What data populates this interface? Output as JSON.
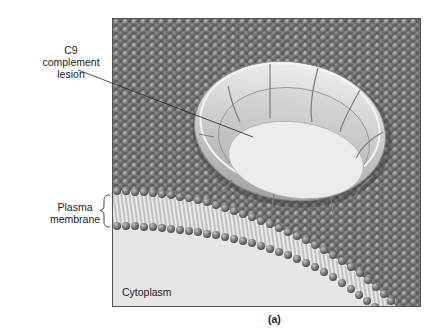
{
  "figure": {
    "panel_label": "(a)",
    "labels": {
      "lesion": [
        "C9",
        "complement",
        "lesion"
      ],
      "membrane": [
        "Plasma",
        "membrane"
      ],
      "cytoplasm": "Cytoplasm"
    },
    "colors": {
      "background": "#ffffff",
      "panel_border": "#555555",
      "phospholipid_head": "#7a7a7a",
      "phospholipid_head_highlight": "#b5b5b5",
      "membrane_surface": "#5e5e5e",
      "tails": "#9a9a9a",
      "cytoplasm": "#e6e6e6",
      "ring": "#cfcfcf",
      "ring_shadow": "#9c9c9c",
      "lesion_hole": "#eeeeee",
      "text": "#222222"
    }
  }
}
